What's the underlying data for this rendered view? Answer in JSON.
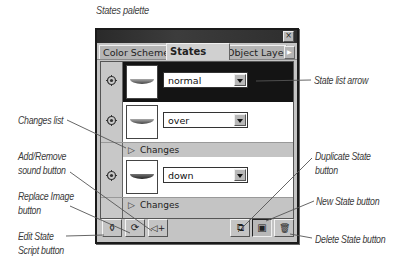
{
  "figure": {
    "title": "States palette"
  },
  "palette": {
    "close_glyph": "×",
    "tabs": [
      {
        "label": "Color Scheme",
        "active": false
      },
      {
        "label": "States",
        "active": true
      },
      {
        "label": "Object Layers",
        "active": false
      }
    ],
    "tab_scroll_glyph": "▶",
    "states": [
      {
        "name": "normal",
        "selected": true,
        "icon": "target-icon",
        "has_changes": false
      },
      {
        "name": "over",
        "selected": false,
        "icon": "target-icon",
        "has_changes": true,
        "changes_label": "Changes"
      },
      {
        "name": "down",
        "selected": false,
        "icon": "target-icon",
        "has_changes": true,
        "changes_label": "Changes"
      }
    ],
    "toolbar": {
      "left": [
        {
          "name": "edit-state-script-button",
          "icon": "script-icon",
          "glyph": "⚱"
        },
        {
          "name": "replace-image-button",
          "icon": "replace-icon",
          "glyph": "⟳"
        },
        {
          "name": "add-remove-sound-button",
          "icon": "sound-icon",
          "glyph": "◁+"
        }
      ],
      "right": [
        {
          "name": "duplicate-state-button",
          "icon": "duplicate-icon",
          "glyph": "⧉"
        },
        {
          "name": "new-state-button",
          "icon": "new-state-icon",
          "glyph": "▣"
        },
        {
          "name": "delete-state-button",
          "icon": "trash-icon",
          "glyph": "🗑"
        }
      ]
    }
  },
  "callouts": {
    "state_list_arrow": "State list arrow",
    "changes_list": "Changes list",
    "add_remove_sound_1": "Add/Remove",
    "add_remove_sound_2": "sound button",
    "replace_image_1": "Replace Image",
    "replace_image_2": "button",
    "edit_state_script_1": "Edit State",
    "edit_state_script_2": "Script button",
    "duplicate_state_1": "Duplicate State",
    "duplicate_state_2": "button",
    "new_state": "New State button",
    "delete_state": "Delete State button"
  },
  "colors": {
    "panel_gray": "#c4c4c4",
    "titlebar": "#2a2a2a",
    "selected_row": "#141414",
    "leader_line": "#555555"
  }
}
